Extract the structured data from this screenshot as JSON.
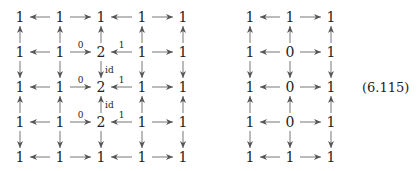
{
  "equation_label": "(6.115)",
  "left_diagram": {
    "columns_x": [
      20,
      60,
      101,
      142,
      183
    ],
    "rows_y": [
      17,
      52,
      87,
      122,
      157
    ],
    "nodes": [
      [
        "1",
        "1",
        "1",
        "1",
        "1"
      ],
      [
        "1",
        "1",
        "2",
        "1",
        "1"
      ],
      [
        "1",
        "1",
        "2",
        "1",
        "1"
      ],
      [
        "1",
        "1",
        "2",
        "1",
        "1"
      ],
      [
        "1",
        "1",
        "1",
        "1",
        "1"
      ]
    ],
    "horizontal_dirs": [
      "left",
      "right",
      "left",
      "right"
    ],
    "horizontal_labels": [
      [
        "",
        "",
        "",
        ""
      ],
      [
        "",
        "0",
        "1",
        ""
      ],
      [
        "",
        "0",
        "1",
        ""
      ],
      [
        "",
        "0",
        "1",
        ""
      ],
      [
        "",
        "",
        "",
        ""
      ]
    ],
    "vertical_dirs": [
      "up",
      "down",
      "up",
      "down"
    ],
    "vertical_labels_middle_column": [
      "",
      "id",
      "id",
      ""
    ]
  },
  "right_diagram": {
    "columns_x": [
      250,
      290,
      331
    ],
    "rows_y": [
      17,
      52,
      87,
      122,
      157
    ],
    "nodes": [
      [
        "1",
        "1",
        "1"
      ],
      [
        "1",
        "0",
        "1"
      ],
      [
        "1",
        "0",
        "1"
      ],
      [
        "1",
        "0",
        "1"
      ],
      [
        "1",
        "1",
        "1"
      ]
    ],
    "horizontal_dirs": [
      "left",
      "right"
    ],
    "vertical_dirs": [
      "up",
      "down",
      "up",
      "down"
    ]
  }
}
